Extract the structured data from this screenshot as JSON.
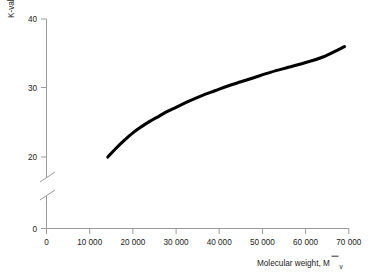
{
  "chart_data": {
    "type": "line",
    "title": "",
    "xlabel": "Molecular weight, M̄ v",
    "xlabel_main": "Molecular weight, M",
    "xlabel_sub": "v",
    "ylabel": "K-value",
    "xlim": [
      0,
      70000
    ],
    "ylim": [
      20,
      40
    ],
    "y_axis_broken": true,
    "y_break_note": "axis broken between 0 and 20",
    "grid": false,
    "legend": null,
    "xticks": [
      0,
      10000,
      20000,
      30000,
      40000,
      50000,
      60000,
      70000
    ],
    "xticklabels": [
      "0",
      "10 000",
      "20 000",
      "30 000",
      "40 000",
      "50 000",
      "60 000",
      "70 000"
    ],
    "yticks": [
      0,
      20,
      30,
      40
    ],
    "yticklabels": [
      "0",
      "20",
      "30",
      "40"
    ],
    "series": [
      {
        "name": "K-value vs molecular weight",
        "x": [
          14200,
          16000,
          18000,
          20000,
          22000,
          24000,
          26000,
          28000,
          30000,
          33000,
          36000,
          39000,
          42000,
          45000,
          48000,
          52000,
          56000,
          60000,
          64000,
          69000
        ],
        "y": [
          20.0,
          21.2,
          22.4,
          23.5,
          24.4,
          25.2,
          25.9,
          26.6,
          27.2,
          28.1,
          28.9,
          29.6,
          30.3,
          30.9,
          31.5,
          32.3,
          33.0,
          33.7,
          34.5,
          36.0
        ]
      }
    ],
    "colors": {
      "curve": "#000000",
      "axis": "#9a9a9a",
      "text": "#1a1a1a",
      "background": "#ffffff"
    }
  }
}
